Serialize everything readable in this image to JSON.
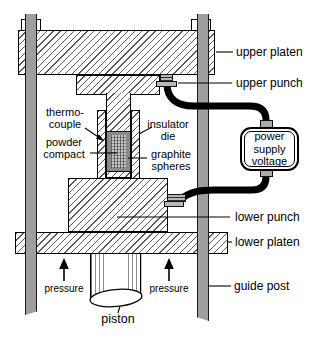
{
  "diagram": {
    "type": "hot-pressing / field-assisted sintering apparatus schematic",
    "labels": {
      "upper_platen": "upper platen",
      "upper_punch": "upper punch",
      "thermocouple": "thermo-\ncouple",
      "powder_compact": "powder\ncompact",
      "insulator_die": "insulator\ndie",
      "graphite_spheres": "graphite\nspheres",
      "power_supply": "power\nsupply\nvoltage",
      "lower_punch": "lower punch",
      "lower_platen": "lower platen",
      "guide_post": "guide post",
      "pressure_left": "pressure",
      "pressure_right": "pressure",
      "piston": "piston"
    },
    "colors": {
      "background": "#ffffff",
      "guide_post_gray": "#9e9e9e",
      "cable_black": "#000000",
      "graphite_spheres_gray": "#8a8a8a",
      "powder_compact_gray": "#c6c6c6",
      "terminal_gray": "#b8b8b8",
      "line_black": "#000000"
    }
  }
}
